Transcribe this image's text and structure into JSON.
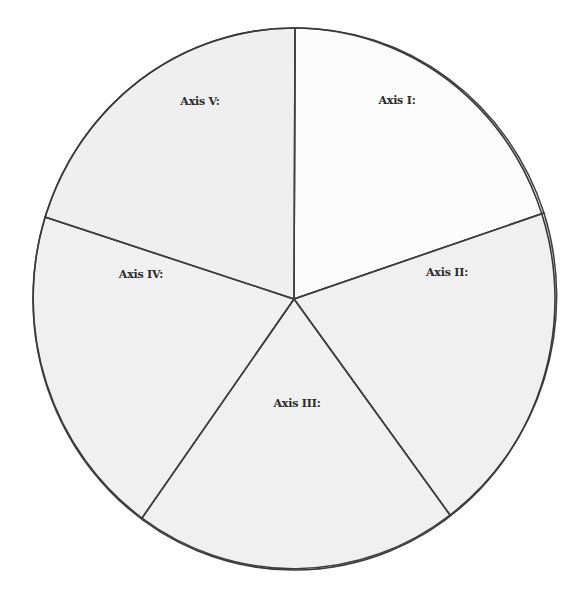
{
  "diagram": {
    "type": "five-segment wheel",
    "center": {
      "x": 294,
      "y": 299
    },
    "radius": {
      "rx": 261,
      "ry": 271
    },
    "stroke_color": "#3f3f3f",
    "segments": [
      {
        "label": "Axis I:",
        "fill": "#fcfcfc",
        "label_pos": {
          "x": 397,
          "y": 104
        }
      },
      {
        "label": "Axis II:",
        "fill": "#f0f0f0",
        "label_pos": {
          "x": 447,
          "y": 276
        }
      },
      {
        "label": "Axis III:",
        "fill": "#f0f0f0",
        "label_pos": {
          "x": 297,
          "y": 407
        }
      },
      {
        "label": "Axis IV:",
        "fill": "#f0f0f0",
        "label_pos": {
          "x": 141,
          "y": 278
        }
      },
      {
        "label": "Axis V:",
        "fill": "#efefef",
        "label_pos": {
          "x": 200,
          "y": 105
        }
      }
    ],
    "spoke_endpoints": [
      {
        "x": 295,
        "y": 28
      },
      {
        "x": 544,
        "y": 213
      },
      {
        "x": 450,
        "y": 515
      },
      {
        "x": 142,
        "y": 518
      },
      {
        "x": 45,
        "y": 217
      }
    ]
  }
}
